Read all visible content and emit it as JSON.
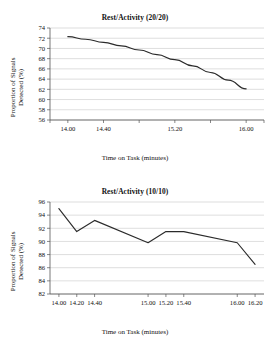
{
  "figure": {
    "background": "#ffffff",
    "line_color": "#2b2b2b",
    "grid_color": "#c8c8c8",
    "axis_color": "#555555"
  },
  "chart_data": [
    {
      "type": "line",
      "title": "Rest/Activity (20/20)",
      "xlabel": "Time on Task (minutes)",
      "ylabel": "Proportion of Signals Detected (%)",
      "ylabel_line1": "Proportion of Signals",
      "ylabel_line2": "Detected (%)",
      "grid": true,
      "legend": "none",
      "ylim": [
        56,
        74
      ],
      "yticks": [
        56,
        58,
        60,
        62,
        64,
        66,
        68,
        70,
        72,
        74
      ],
      "ytick_labels": [
        "56",
        "58",
        "60",
        "62",
        "64",
        "66",
        "68",
        "70",
        "72",
        "74"
      ],
      "xlim": [
        13.8,
        16.2
      ],
      "xticks": [
        14.0,
        14.4,
        15.2,
        16.0
      ],
      "xtick_labels": [
        "14.00",
        "14.40",
        "15.20",
        "16.00"
      ],
      "x_minor_ticks": [
        13.8,
        14.0,
        14.4,
        14.8,
        15.2,
        15.6,
        16.0,
        16.2
      ],
      "x": [
        14.0,
        14.2,
        14.4,
        14.6,
        14.8,
        15.0,
        15.2,
        15.4,
        15.6,
        15.8,
        16.0
      ],
      "values": [
        72.3,
        71.8,
        71.2,
        70.5,
        69.7,
        68.8,
        67.8,
        66.6,
        65.3,
        63.8,
        62.1
      ]
    },
    {
      "type": "line",
      "title": "Rest/Activity (10/10)",
      "xlabel": "Time on Task (minutes)",
      "ylabel": "Proportion of Signals Detected (%)",
      "ylabel_line1": "Proportion of Signals",
      "ylabel_line2": "Detected (%)",
      "grid": true,
      "legend": "none",
      "ylim": [
        82,
        96
      ],
      "yticks": [
        82,
        84,
        86,
        88,
        90,
        92,
        94,
        96
      ],
      "ytick_labels": [
        "82",
        "84",
        "86",
        "88",
        "90",
        "92",
        "94",
        "96"
      ],
      "xlim": [
        13.9,
        16.3
      ],
      "xticks": [
        14.0,
        14.2,
        14.4,
        15.0,
        15.2,
        15.4,
        16.0,
        16.2
      ],
      "xtick_labels": [
        "14.00",
        "14.20",
        "14.40",
        "15.00",
        "15.20",
        "15.40",
        "16.00",
        "16.20"
      ],
      "x": [
        14.0,
        14.2,
        14.4,
        15.0,
        15.2,
        15.4,
        16.0,
        16.2
      ],
      "values": [
        95.0,
        91.5,
        93.2,
        89.8,
        91.5,
        91.5,
        89.8,
        86.5
      ]
    }
  ]
}
